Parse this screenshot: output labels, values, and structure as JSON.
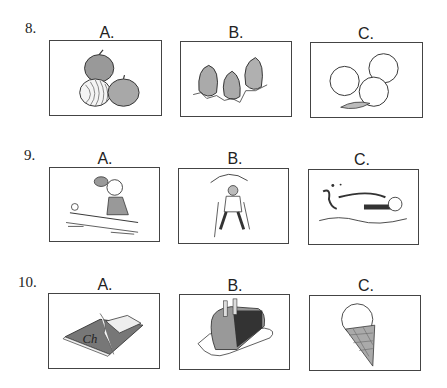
{
  "questions": [
    {
      "number": "8.",
      "options": [
        {
          "label": "A.",
          "picture": "onions"
        },
        {
          "label": "B.",
          "picture": "strawberries"
        },
        {
          "label": "C.",
          "picture": "peaches"
        }
      ]
    },
    {
      "number": "9.",
      "options": [
        {
          "label": "A.",
          "picture": "girl playing table tennis"
        },
        {
          "label": "B.",
          "picture": "person hiking / mountain climbing"
        },
        {
          "label": "C.",
          "picture": "person swimming"
        }
      ]
    },
    {
      "number": "10.",
      "options": [
        {
          "label": "A.",
          "picture": "chocolate bar"
        },
        {
          "label": "B.",
          "picture": "cake"
        },
        {
          "label": "C.",
          "picture": "ice cream cone"
        }
      ]
    }
  ]
}
